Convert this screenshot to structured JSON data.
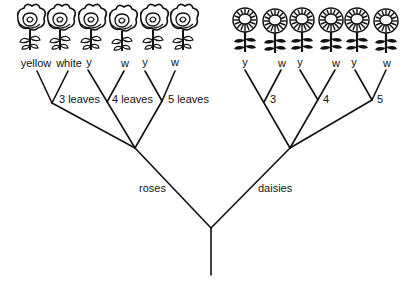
{
  "diagram": {
    "type": "branching-tree",
    "root": {
      "branches": [
        {
          "label": "roses",
          "flower_icon": "rose-icon",
          "groups": [
            {
              "label": "3 leaves",
              "leaves": [
                "yellow",
                "white"
              ]
            },
            {
              "label": "4 leaves",
              "leaves": [
                "y",
                "w"
              ]
            },
            {
              "label": "5 leaves",
              "leaves": [
                "y",
                "w"
              ]
            }
          ]
        },
        {
          "label": "daisies",
          "flower_icon": "daisy-icon",
          "groups": [
            {
              "label": "3",
              "leaves": [
                "y",
                "w"
              ]
            },
            {
              "label": "4",
              "leaves": [
                "y",
                "w"
              ]
            },
            {
              "label": "5",
              "leaves": [
                "y",
                "w"
              ]
            }
          ]
        }
      ]
    }
  },
  "colors": {
    "line": "#111111",
    "background": "#ffffff"
  }
}
